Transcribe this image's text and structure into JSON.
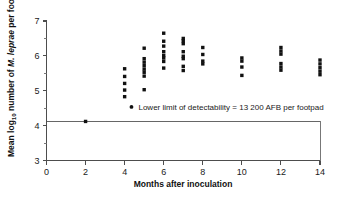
{
  "chart_data": {
    "type": "scatter",
    "title": "",
    "xlabel": "Months after inoculation",
    "ylabel": "Mean log10 number of M. leprae per footpad",
    "ylabel_parts": {
      "pre": "Mean log",
      "subscript": "10",
      "mid": " number of ",
      "italic": "M. leprae",
      "post": " per footpad"
    },
    "xlim": [
      0,
      14
    ],
    "ylim": [
      3,
      7
    ],
    "xticks": [
      0,
      2,
      4,
      6,
      8,
      10,
      12,
      14
    ],
    "xtick_labels": [
      "0",
      "2",
      "4",
      "6",
      "8",
      "10",
      "12",
      "14"
    ],
    "yticks": [
      3,
      4,
      5,
      6,
      7
    ],
    "ytick_labels": [
      "3",
      "4",
      "5",
      "6",
      "7"
    ],
    "yticks_minor": [
      3.5,
      4.5,
      5.5,
      6.5
    ],
    "grid": false,
    "legend": null,
    "detectability_line": {
      "value": 4.12,
      "label": "Lower limit of detectability = 13 200 AFB per footpad",
      "marker": "•"
    },
    "annotation": {
      "text": "Lower limit of detectability = 13 200 AFB per footpad",
      "x": 4.35,
      "y": 4.45
    },
    "series": [
      {
        "name": "Mean log10 M. leprae per footpad",
        "points": [
          {
            "x": 2,
            "y": 4.12
          },
          {
            "x": 4,
            "y": 5.63
          },
          {
            "x": 4,
            "y": 5.41
          },
          {
            "x": 4,
            "y": 5.21
          },
          {
            "x": 4,
            "y": 5.02
          },
          {
            "x": 4,
            "y": 4.83
          },
          {
            "x": 5,
            "y": 6.22
          },
          {
            "x": 5,
            "y": 5.92
          },
          {
            "x": 5,
            "y": 5.82
          },
          {
            "x": 5,
            "y": 5.72
          },
          {
            "x": 5,
            "y": 5.62
          },
          {
            "x": 5,
            "y": 5.53
          },
          {
            "x": 5,
            "y": 5.42
          },
          {
            "x": 5,
            "y": 5.03
          },
          {
            "x": 6,
            "y": 6.65
          },
          {
            "x": 6,
            "y": 6.42
          },
          {
            "x": 6,
            "y": 6.28
          },
          {
            "x": 6,
            "y": 6.12
          },
          {
            "x": 6,
            "y": 6.01
          },
          {
            "x": 6,
            "y": 5.94
          },
          {
            "x": 6,
            "y": 5.84
          },
          {
            "x": 6,
            "y": 5.65
          },
          {
            "x": 7,
            "y": 6.5
          },
          {
            "x": 7,
            "y": 6.43
          },
          {
            "x": 7,
            "y": 6.35
          },
          {
            "x": 7,
            "y": 6.12
          },
          {
            "x": 7,
            "y": 5.99
          },
          {
            "x": 7,
            "y": 5.92
          },
          {
            "x": 7,
            "y": 5.7
          },
          {
            "x": 7,
            "y": 5.58
          },
          {
            "x": 8,
            "y": 6.24
          },
          {
            "x": 8,
            "y": 6.04
          },
          {
            "x": 8,
            "y": 5.85
          },
          {
            "x": 8,
            "y": 5.77
          },
          {
            "x": 10,
            "y": 5.94
          },
          {
            "x": 10,
            "y": 5.85
          },
          {
            "x": 10,
            "y": 5.68
          },
          {
            "x": 10,
            "y": 5.44
          },
          {
            "x": 12,
            "y": 6.24
          },
          {
            "x": 12,
            "y": 6.14
          },
          {
            "x": 12,
            "y": 6.05
          },
          {
            "x": 12,
            "y": 5.78
          },
          {
            "x": 12,
            "y": 5.68
          },
          {
            "x": 12,
            "y": 5.59
          },
          {
            "x": 14,
            "y": 5.88
          },
          {
            "x": 14,
            "y": 5.77
          },
          {
            "x": 14,
            "y": 5.66
          },
          {
            "x": 14,
            "y": 5.56
          },
          {
            "x": 14,
            "y": 5.46
          }
        ]
      }
    ]
  },
  "colors": {
    "point": "#111111",
    "axis": "#4d4d4d",
    "limit_line": "#666666",
    "background": "#ffffff",
    "text": "#1a1a1a"
  }
}
